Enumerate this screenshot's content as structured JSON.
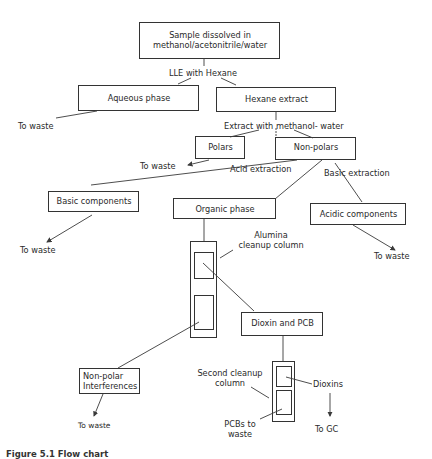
{
  "diagram": {
    "nodes": {
      "sample": {
        "line1": "Sample dissolved in",
        "line2": "methanol/acetonitrile/water"
      },
      "aqueous": "Aqueous phase",
      "hexane": "Hexane extract",
      "polars": "Polars",
      "nonpolars": "Non-polars",
      "basic": "Basic components",
      "organic": "Organic phase",
      "acidic": "Acidic components",
      "dioxin_pcb": "Dioxin and PCB",
      "nonpolar_interf": {
        "line1": "Non-polar",
        "line2": "Interferences"
      }
    },
    "edges": {
      "lle": "LLE with Hexane",
      "extract_mw": "Extract with methanol- water",
      "acid_extraction": "Acid extraction",
      "basic_extraction": "Basic extraction"
    },
    "annotations": {
      "alumina": {
        "line1": "Alumina",
        "line2": "cleanup column"
      },
      "second_column": {
        "line1": "Second cleanup",
        "line2": "column"
      },
      "dioxins": "Dioxins",
      "pcbs_waste": {
        "line1": "PCBs to",
        "line2": "waste"
      },
      "to_gc": "To GC"
    },
    "waste_labels": {
      "aqueous": "To waste",
      "polars": "To waste",
      "basic": "To waste",
      "acidic": "To waste",
      "nonpolar_interf": "To waste"
    },
    "caption": "Figure 5.1 Flow chart"
  }
}
